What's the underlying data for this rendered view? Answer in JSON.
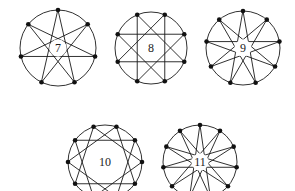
{
  "figure_set": {
    "title": "",
    "background_color": "#ffffff",
    "stroke_color": "#1a1a1a",
    "vertex_color": "#111111",
    "label_color": "#1c1c1c"
  },
  "chart_data": {
    "type": "diagram",
    "title": "",
    "subtitle": "",
    "xlabel": "",
    "ylabel": "",
    "legend": [],
    "categories": [
      "7",
      "8",
      "9",
      "10",
      "11"
    ],
    "values": [
      7,
      8,
      9,
      10,
      11
    ],
    "series": [
      {
        "name": "vertices",
        "values": [
          7,
          8,
          9,
          10,
          11
        ]
      },
      {
        "name": "step",
        "values": [
          3,
          3,
          4,
          3,
          5
        ]
      }
    ]
  },
  "figures": [
    {
      "id": "figure-7",
      "label": "7",
      "n": 7,
      "step": 3,
      "cx": 58,
      "cy": 48,
      "r": 38,
      "dot_r": 2.3,
      "rotation_deg": -90,
      "label_x": 58,
      "label_y": 48,
      "label_size": 12
    },
    {
      "id": "figure-8",
      "label": "8",
      "n": 8,
      "step": 3,
      "cx": 151,
      "cy": 48,
      "r": 36,
      "dot_r": 2.3,
      "rotation_deg": -67.5,
      "label_x": 151,
      "label_y": 48,
      "label_size": 12
    },
    {
      "id": "figure-9",
      "label": "9",
      "n": 9,
      "step": 4,
      "cx": 243,
      "cy": 48,
      "r": 37,
      "dot_r": 2.3,
      "rotation_deg": -90,
      "label_x": 243,
      "label_y": 48,
      "label_size": 12
    },
    {
      "id": "figure-10",
      "label": "10",
      "n": 10,
      "step": 3,
      "cx": 105,
      "cy": 162,
      "r": 37,
      "dot_r": 2.3,
      "rotation_deg": -72,
      "label_x": 105,
      "label_y": 162,
      "label_size": 12
    },
    {
      "id": "figure-11",
      "label": "11",
      "n": 11,
      "step": 5,
      "cx": 200,
      "cy": 162,
      "r": 37,
      "dot_r": 2.3,
      "rotation_deg": -90,
      "label_x": 200,
      "label_y": 162,
      "label_size": 12
    }
  ]
}
